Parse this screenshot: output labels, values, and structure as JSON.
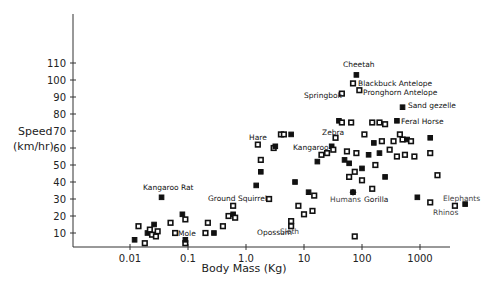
{
  "chart_data": {
    "type": "scatter",
    "title": "",
    "xlabel": "Body Mass (Kg)",
    "ylabel": "Speed (km/hr)",
    "ylabel_lines": [
      "Speed",
      "(km/hr)"
    ],
    "x_scale": "log",
    "x_ticks": [
      0.01,
      0.1,
      1.0,
      10,
      100,
      1000
    ],
    "x_tick_labels": [
      "0.01",
      "0.1",
      "1.0",
      "10",
      "100",
      "1000"
    ],
    "y_ticks": [
      10,
      20,
      30,
      40,
      50,
      60,
      70,
      80,
      90,
      100,
      110
    ],
    "y_tick_labels": [
      "10",
      "20",
      "30",
      "40",
      "50",
      "60",
      "70",
      "80",
      "90",
      "100",
      "110"
    ],
    "xlim": [
      0.002,
      8000
    ],
    "ylim": [
      0,
      130
    ],
    "grid": false,
    "legend": null,
    "labeled_points": [
      {
        "name": "Cheetah",
        "x": 80,
        "y": 103
      },
      {
        "name": "Blackbuck Antelope",
        "x": 70,
        "y": 98
      },
      {
        "name": "Pronghorn Antelope",
        "x": 90,
        "y": 94
      },
      {
        "name": "Springbok",
        "x": 45,
        "y": 92
      },
      {
        "name": "Sand gezelle",
        "x": 500,
        "y": 84
      },
      {
        "name": "Feral Horse",
        "x": 400,
        "y": 76
      },
      {
        "name": "Zebra",
        "x": 35,
        "y": 66
      },
      {
        "name": "Kangaroo",
        "x": 30,
        "y": 61
      },
      {
        "name": "Hare",
        "x": 1.6,
        "y": 62
      },
      {
        "name": "Kangaroo Rat",
        "x": 0.035,
        "y": 31
      },
      {
        "name": "Ground Squirrel",
        "x": 0.6,
        "y": 26
      },
      {
        "name": "Mole",
        "x": 0.09,
        "y": 4
      },
      {
        "name": "Opossum",
        "x": 0.28,
        "y": 10
      },
      {
        "name": "Sloth",
        "x": 6,
        "y": 14
      },
      {
        "name": "Humans",
        "x": 70,
        "y": 34
      },
      {
        "name": "Gorilla",
        "x": 150,
        "y": 36
      },
      {
        "name": "Elephants",
        "x": 6000,
        "y": 27
      },
      {
        "name": "Rhinos",
        "x": 4000,
        "y": 26
      }
    ],
    "points": [
      {
        "x": 0.012,
        "y": 6
      },
      {
        "x": 0.014,
        "y": 14
      },
      {
        "x": 0.018,
        "y": 4
      },
      {
        "x": 0.02,
        "y": 10
      },
      {
        "x": 0.022,
        "y": 12
      },
      {
        "x": 0.024,
        "y": 9
      },
      {
        "x": 0.026,
        "y": 15
      },
      {
        "x": 0.028,
        "y": 8
      },
      {
        "x": 0.03,
        "y": 11
      },
      {
        "x": 0.035,
        "y": 31
      },
      {
        "x": 0.05,
        "y": 16
      },
      {
        "x": 0.06,
        "y": 10
      },
      {
        "x": 0.08,
        "y": 21
      },
      {
        "x": 0.09,
        "y": 18
      },
      {
        "x": 0.09,
        "y": 4
      },
      {
        "x": 0.09,
        "y": 6
      },
      {
        "x": 0.2,
        "y": 10
      },
      {
        "x": 0.22,
        "y": 16
      },
      {
        "x": 0.28,
        "y": 10
      },
      {
        "x": 0.4,
        "y": 14
      },
      {
        "x": 0.5,
        "y": 20
      },
      {
        "x": 0.6,
        "y": 21
      },
      {
        "x": 0.65,
        "y": 19
      },
      {
        "x": 0.6,
        "y": 26
      },
      {
        "x": 1.5,
        "y": 38
      },
      {
        "x": 1.6,
        "y": 62
      },
      {
        "x": 1.8,
        "y": 53
      },
      {
        "x": 1.8,
        "y": 46
      },
      {
        "x": 2.5,
        "y": 30
      },
      {
        "x": 3,
        "y": 60
      },
      {
        "x": 3.2,
        "y": 61
      },
      {
        "x": 4,
        "y": 68
      },
      {
        "x": 4.5,
        "y": 68
      },
      {
        "x": 6,
        "y": 68
      },
      {
        "x": 6,
        "y": 14
      },
      {
        "x": 6,
        "y": 17
      },
      {
        "x": 7,
        "y": 40
      },
      {
        "x": 8,
        "y": 26
      },
      {
        "x": 10,
        "y": 21
      },
      {
        "x": 12,
        "y": 34
      },
      {
        "x": 14,
        "y": 23
      },
      {
        "x": 15,
        "y": 32
      },
      {
        "x": 17,
        "y": 52
      },
      {
        "x": 20,
        "y": 56
      },
      {
        "x": 25,
        "y": 57
      },
      {
        "x": 30,
        "y": 61
      },
      {
        "x": 32,
        "y": 59
      },
      {
        "x": 35,
        "y": 66
      },
      {
        "x": 40,
        "y": 76
      },
      {
        "x": 45,
        "y": 75
      },
      {
        "x": 45,
        "y": 92
      },
      {
        "x": 50,
        "y": 53
      },
      {
        "x": 55,
        "y": 58
      },
      {
        "x": 60,
        "y": 43
      },
      {
        "x": 60,
        "y": 51
      },
      {
        "x": 65,
        "y": 75
      },
      {
        "x": 70,
        "y": 98
      },
      {
        "x": 70,
        "y": 34
      },
      {
        "x": 75,
        "y": 46
      },
      {
        "x": 75,
        "y": 8
      },
      {
        "x": 80,
        "y": 103
      },
      {
        "x": 80,
        "y": 57
      },
      {
        "x": 90,
        "y": 94
      },
      {
        "x": 100,
        "y": 48
      },
      {
        "x": 100,
        "y": 41
      },
      {
        "x": 110,
        "y": 68
      },
      {
        "x": 130,
        "y": 56
      },
      {
        "x": 150,
        "y": 75
      },
      {
        "x": 150,
        "y": 36
      },
      {
        "x": 160,
        "y": 63
      },
      {
        "x": 170,
        "y": 50
      },
      {
        "x": 200,
        "y": 75
      },
      {
        "x": 200,
        "y": 57
      },
      {
        "x": 220,
        "y": 64
      },
      {
        "x": 250,
        "y": 74
      },
      {
        "x": 250,
        "y": 43
      },
      {
        "x": 300,
        "y": 59
      },
      {
        "x": 350,
        "y": 64
      },
      {
        "x": 400,
        "y": 76
      },
      {
        "x": 400,
        "y": 55
      },
      {
        "x": 450,
        "y": 68
      },
      {
        "x": 500,
        "y": 84
      },
      {
        "x": 500,
        "y": 65
      },
      {
        "x": 550,
        "y": 56
      },
      {
        "x": 600,
        "y": 65
      },
      {
        "x": 700,
        "y": 64
      },
      {
        "x": 800,
        "y": 55
      },
      {
        "x": 900,
        "y": 31
      },
      {
        "x": 1500,
        "y": 28
      },
      {
        "x": 1500,
        "y": 57
      },
      {
        "x": 1500,
        "y": 66
      },
      {
        "x": 2000,
        "y": 44
      },
      {
        "x": 4000,
        "y": 26
      },
      {
        "x": 6000,
        "y": 27
      }
    ]
  },
  "annotations": [
    {
      "text": "Cheetah",
      "px": 343,
      "py": 67
    },
    {
      "text": "Blackbuck Antelope",
      "px": 358,
      "py": 86
    },
    {
      "text": "Pronghorn Antelope",
      "px": 363,
      "py": 95
    },
    {
      "text": "Springbok",
      "px": 304,
      "py": 98
    },
    {
      "text": "Sand gezelle",
      "px": 408,
      "py": 108
    },
    {
      "text": "Feral Horse",
      "px": 401,
      "py": 124
    },
    {
      "text": "Zebra",
      "px": 322,
      "py": 135
    },
    {
      "text": "Kangaroo",
      "px": 293,
      "py": 150
    },
    {
      "text": "Hare",
      "px": 249,
      "py": 140
    },
    {
      "text": "Kangaroo Rat",
      "px": 143,
      "py": 190
    },
    {
      "text": "Ground Squirrel",
      "px": 208,
      "py": 201
    },
    {
      "text": "Mole",
      "px": 178,
      "py": 236
    },
    {
      "text": "Opossum",
      "px": 257,
      "py": 235
    },
    {
      "text": "Sloth",
      "px": 280,
      "py": 234
    },
    {
      "text": "Humans",
      "px": 330,
      "py": 202
    },
    {
      "text": "Gorilla",
      "px": 364,
      "py": 202
    },
    {
      "text": "Elephants",
      "px": 443,
      "py": 201
    },
    {
      "text": "Rhinos",
      "px": 433,
      "py": 215
    }
  ]
}
